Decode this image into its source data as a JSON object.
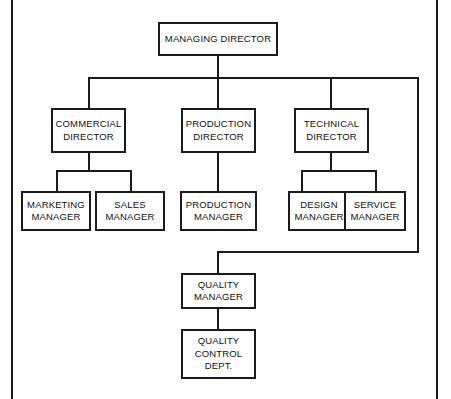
{
  "diagram": {
    "type": "organisation-chart",
    "line_color": "#1b1b1b",
    "box_fill": "#ffffff",
    "frame_color": "#1c1c1c"
  },
  "nodes": {
    "managing_director": {
      "lines": [
        "MANAGING DIRECTOR"
      ],
      "level": 1
    },
    "commercial_director": {
      "lines": [
        "COMMERCIAL",
        "DIRECTOR"
      ],
      "level": 2
    },
    "production_director": {
      "lines": [
        "PRODUCTION",
        "DIRECTOR"
      ],
      "level": 2
    },
    "technical_director": {
      "lines": [
        "TECHNICAL",
        "DIRECTOR"
      ],
      "level": 2
    },
    "marketing_manager": {
      "lines": [
        "MARKETING",
        "MANAGER"
      ],
      "level": 3
    },
    "sales_manager": {
      "lines": [
        "SALES",
        "MANAGER"
      ],
      "level": 3
    },
    "production_manager": {
      "lines": [
        "PRODUCTION",
        "MANAGER"
      ],
      "level": 3
    },
    "design_manager": {
      "lines": [
        "DESIGN",
        "MANAGER"
      ],
      "level": 3
    },
    "service_manager": {
      "lines": [
        "SERVICE",
        "MANAGER"
      ],
      "level": 3
    },
    "quality_manager": {
      "lines": [
        "QUALITY",
        "MANAGER"
      ],
      "level": 3
    },
    "quality_control_dept": {
      "lines": [
        "QUALITY",
        "CONTROL",
        "DEPT."
      ],
      "level": 4
    }
  },
  "relationships": [
    {
      "from": "managing_director",
      "to": "commercial_director"
    },
    {
      "from": "managing_director",
      "to": "production_director"
    },
    {
      "from": "managing_director",
      "to": "technical_director"
    },
    {
      "from": "managing_director",
      "to": "quality_manager"
    },
    {
      "from": "commercial_director",
      "to": "marketing_manager"
    },
    {
      "from": "commercial_director",
      "to": "sales_manager"
    },
    {
      "from": "production_director",
      "to": "production_manager"
    },
    {
      "from": "technical_director",
      "to": "design_manager"
    },
    {
      "from": "technical_director",
      "to": "service_manager"
    },
    {
      "from": "quality_manager",
      "to": "quality_control_dept"
    }
  ]
}
